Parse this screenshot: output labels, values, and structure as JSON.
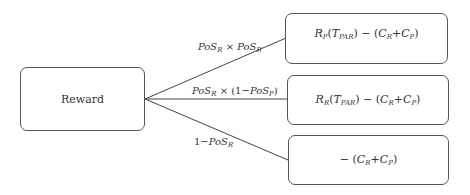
{
  "diagram": {
    "root": {
      "label": "Reward"
    },
    "branches": [
      {
        "edge_label": {
          "a": "PoS",
          "a_sub": "R",
          "op": " × ",
          "b": "PoS",
          "b_sub": "R"
        },
        "outcome": {
          "r": "R",
          "r_sub": "P",
          "t": "T",
          "t_sub": "PAR",
          "rest": ") − (",
          "c1": "C",
          "c1_sub": "R",
          "plus": "+",
          "c2": "C",
          "c2_sub": "P",
          "close": ")"
        }
      },
      {
        "edge_label": {
          "a": "PoS",
          "a_sub": "R",
          "op": " × (1−",
          "b": "PoS",
          "b_sub": "P",
          "close": ")"
        },
        "outcome": {
          "r": "R",
          "r_sub": "R",
          "t": "T",
          "t_sub": "PAR",
          "rest": ") − (",
          "c1": "C",
          "c1_sub": "R",
          "plus": "+",
          "c2": "C",
          "c2_sub": "P",
          "close": ")"
        }
      },
      {
        "edge_label": {
          "pre": "1−",
          "a": "PoS",
          "a_sub": "R"
        },
        "outcome": {
          "pre": "− (",
          "c1": "C",
          "c1_sub": "R",
          "plus": "+",
          "c2": "C",
          "c2_sub": "P",
          "close": ")"
        }
      }
    ]
  }
}
